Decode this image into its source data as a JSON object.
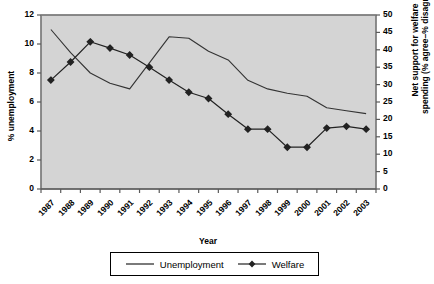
{
  "chart_data": {
    "type": "line",
    "title": "",
    "xlabel": "Year",
    "ylabel": "% unemployment",
    "y2label_line1": "Net support for welfare",
    "y2label_line2": "spending (% agree–% disagree)",
    "categories": [
      "1987",
      "1988",
      "1989",
      "1990",
      "1991",
      "1992",
      "1993",
      "1994",
      "1995",
      "1996",
      "1997",
      "1998",
      "1999",
      "2000",
      "2001",
      "2002",
      "2003"
    ],
    "ylim": [
      0,
      12
    ],
    "yticks": [
      0,
      2,
      4,
      6,
      8,
      10,
      12
    ],
    "y2lim": [
      0,
      50
    ],
    "y2ticks": [
      0,
      5,
      10,
      15,
      20,
      25,
      30,
      35,
      40,
      45,
      50
    ],
    "grid": false,
    "legend_position": "bottom",
    "plot_background": "#d4d4d4",
    "series": [
      {
        "name": "Unemployment",
        "axis": "left",
        "marker": "none",
        "color": "#333333",
        "values": [
          11.0,
          9.4,
          8.0,
          7.3,
          6.9,
          8.7,
          10.5,
          10.4,
          9.5,
          8.9,
          7.5,
          6.9,
          6.6,
          6.4,
          5.6,
          5.4,
          5.2
        ]
      },
      {
        "name": "Welfare",
        "axis": "right",
        "marker": "diamond",
        "color": "#222222",
        "values": [
          31.3,
          36.5,
          42.3,
          40.5,
          38.5,
          35.0,
          31.3,
          27.8,
          26.0,
          21.5,
          17.2,
          17.2,
          12.0,
          12.0,
          17.5,
          18.0,
          17.2
        ]
      }
    ],
    "legend": [
      {
        "label": "Unemployment",
        "marker": "none"
      },
      {
        "label": "Welfare",
        "marker": "diamond"
      }
    ]
  }
}
